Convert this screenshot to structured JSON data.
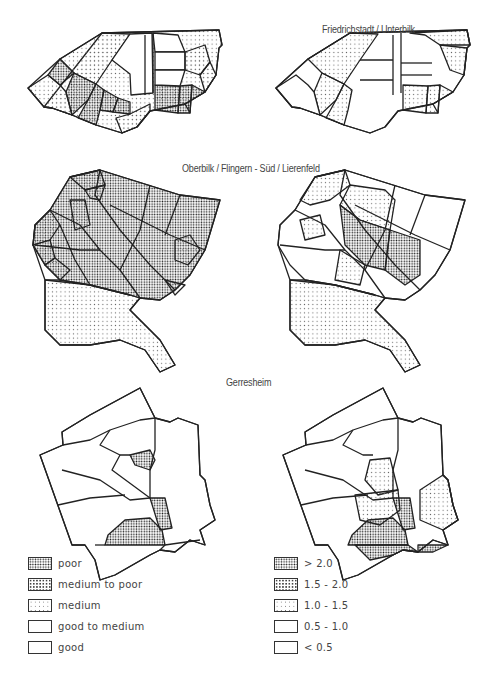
{
  "regions": [
    {
      "title": "Friedrichstadt / Unterbilk"
    },
    {
      "title": "Oberbilk / Flingern - Süd / Lierenfeld"
    },
    {
      "title": "Gerresheim"
    }
  ],
  "legend_left": {
    "items": [
      {
        "label": "poor",
        "pattern": "dense"
      },
      {
        "label": "medium to poor",
        "pattern": "mid"
      },
      {
        "label": "medium",
        "pattern": "light"
      },
      {
        "label": "good to medium",
        "pattern": "none"
      },
      {
        "label": "good",
        "pattern": "none"
      }
    ]
  },
  "legend_right": {
    "items": [
      {
        "label": "> 2.0",
        "pattern": "dense"
      },
      {
        "label": "1.5 - 2.0",
        "pattern": "mid"
      },
      {
        "label": "1.0 - 1.5",
        "pattern": "light"
      },
      {
        "label": "0.5 - 1.0",
        "pattern": "none"
      },
      {
        "label": "< 0.5",
        "pattern": "none"
      }
    ]
  },
  "colors": {
    "ink": "#222222",
    "paper": "#ffffff"
  }
}
